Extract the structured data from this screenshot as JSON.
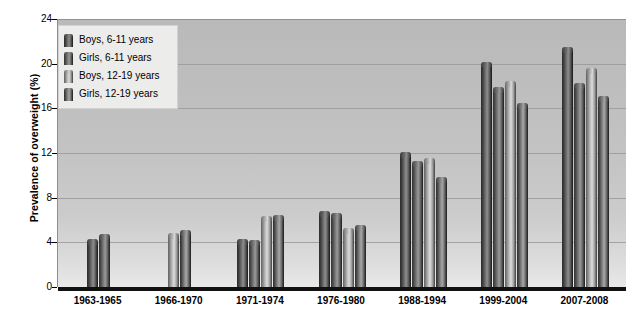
{
  "chart_data": {
    "type": "bar",
    "title": "",
    "xlabel": "",
    "ylabel": "Prevalence of overweight (%)",
    "ylim": [
      0,
      24
    ],
    "yticks": [
      0,
      4,
      8,
      12,
      16,
      20,
      24
    ],
    "grid": true,
    "legend_position": "upper-left",
    "categories": [
      "1963-1965",
      "1966-1970",
      "1971-1974",
      "1976-1980",
      "1988-1994",
      "1999-2004",
      "2007-2008"
    ],
    "series": [
      {
        "name": "Boys, 6-11 years",
        "values": [
          4.0,
          null,
          4.0,
          6.5,
          11.8,
          19.9,
          21.2
        ]
      },
      {
        "name": "Girls, 6-11 years",
        "values": [
          4.5,
          null,
          3.9,
          6.4,
          11.0,
          17.6,
          18.0
        ]
      },
      {
        "name": "Boys, 12-19 years",
        "values": [
          null,
          4.6,
          6.1,
          5.0,
          11.3,
          18.2,
          19.3
        ]
      },
      {
        "name": "Girls, 12-19 years",
        "values": [
          null,
          4.8,
          6.2,
          5.3,
          9.6,
          16.2,
          16.8
        ]
      }
    ]
  },
  "axis": {
    "y_title": "Prevalence of overweight (%)",
    "y_tick_labels": [
      "0",
      "4",
      "8",
      "12",
      "16",
      "20",
      "24"
    ],
    "x_tick_labels": [
      "1963-1965",
      "1966-1970",
      "1971-1974",
      "1976-1980",
      "1988-1994",
      "1999-2004",
      "2007-2008"
    ]
  },
  "legend": {
    "items": [
      {
        "label": "Boys, 6-11 years",
        "swatch": "legend-swatch-boys-6-11",
        "color": "#6f6f6f"
      },
      {
        "label": "Girls, 6-11 years",
        "swatch": "legend-swatch-girls-6-11",
        "color": "#7b7b7b"
      },
      {
        "label": "Boys, 12-19 years",
        "swatch": "legend-swatch-boys-12-19",
        "color": "#bcbcbc"
      },
      {
        "label": "Girls, 12-19 years",
        "swatch": "legend-swatch-girls-12-19",
        "color": "#868686"
      }
    ]
  },
  "style": {
    "plot_background": "#c3c3c3",
    "gridline_color": "#9a9a9a",
    "axis_color": "#111111",
    "legend_background": "#ececeb",
    "text_color": "#000000"
  }
}
